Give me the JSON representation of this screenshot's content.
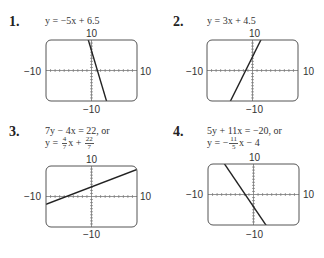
{
  "problems": [
    {
      "number": "1.",
      "equation_line1": "y = −5x + 6.5",
      "equation_line2": ""
    },
    {
      "number": "2.",
      "equation_line1": "y = 3x + 4.5",
      "equation_line2": ""
    },
    {
      "number": "3.",
      "equation_line1": "7y − 4x = 22, or",
      "equation_line2_prefix": "y = ",
      "frac1_num": "4",
      "frac1_den": "7",
      "mid": "x + ",
      "frac2_num": "22",
      "frac2_den": "7"
    },
    {
      "number": "4.",
      "equation_line1": "5y + 11x = −20, or",
      "equation_line2_prefix": "y = −",
      "frac1_num": "11",
      "frac1_den": "5",
      "mid": "x − 4"
    }
  ],
  "window": {
    "xmin_label": "−10",
    "xmax_label": "10",
    "ymin_label": "−10",
    "ymax_label": "10"
  },
  "chart_data": [
    {
      "type": "line",
      "title": "y = -5x + 6.5",
      "xlim": [
        -10,
        10
      ],
      "ylim": [
        -10,
        10
      ],
      "slope": -5,
      "intercept": 6.5,
      "grid": false
    },
    {
      "type": "line",
      "title": "y = 3x + 4.5",
      "xlim": [
        -10,
        10
      ],
      "ylim": [
        -10,
        10
      ],
      "slope": 3,
      "intercept": 4.5,
      "grid": false
    },
    {
      "type": "line",
      "title": "y = (4/7)x + 22/7",
      "xlim": [
        -10,
        10
      ],
      "ylim": [
        -10,
        10
      ],
      "slope": 0.5714,
      "intercept": 3.1429,
      "grid": false
    },
    {
      "type": "line",
      "title": "y = -(11/5)x - 4",
      "xlim": [
        -10,
        10
      ],
      "ylim": [
        -10,
        10
      ],
      "slope": -2.2,
      "intercept": -4,
      "grid": false
    }
  ]
}
